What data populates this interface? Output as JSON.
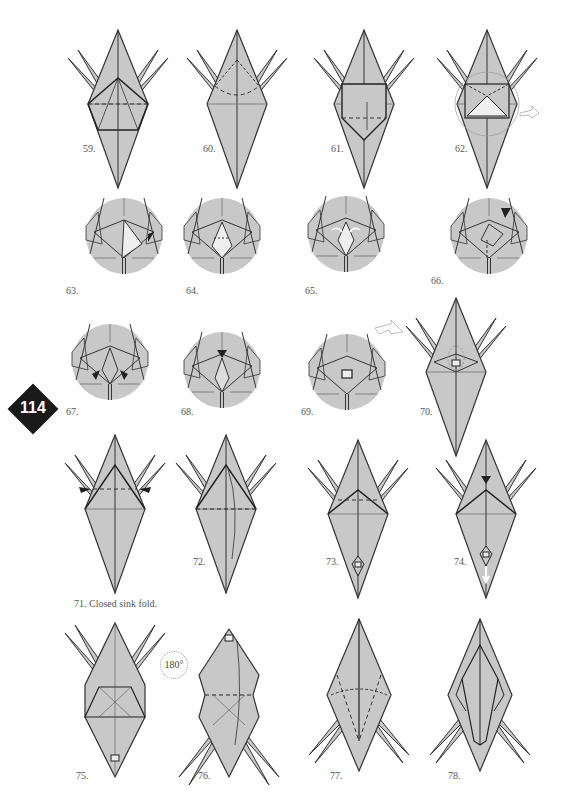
{
  "page": {
    "number": "114",
    "fill_color": "#c8c8c8",
    "line_color": "#333333"
  },
  "steps": [
    {
      "id": "59",
      "label": "59."
    },
    {
      "id": "60",
      "label": "60."
    },
    {
      "id": "61",
      "label": "61."
    },
    {
      "id": "62",
      "label": "62."
    },
    {
      "id": "63",
      "label": "63."
    },
    {
      "id": "64",
      "label": "64."
    },
    {
      "id": "65",
      "label": "65."
    },
    {
      "id": "66",
      "label": "66."
    },
    {
      "id": "67",
      "label": "67."
    },
    {
      "id": "68",
      "label": "68."
    },
    {
      "id": "69",
      "label": "69."
    },
    {
      "id": "70",
      "label": "70."
    },
    {
      "id": "71",
      "label": "71. Closed sink fold."
    },
    {
      "id": "72",
      "label": "72."
    },
    {
      "id": "73",
      "label": "73."
    },
    {
      "id": "74",
      "label": "74."
    },
    {
      "id": "75",
      "label": "75."
    },
    {
      "id": "76",
      "label": "76."
    },
    {
      "id": "77",
      "label": "77."
    },
    {
      "id": "78",
      "label": "78."
    }
  ],
  "annotations": {
    "rotate": "180°",
    "icons": [
      "valley-fold-arrow-icon",
      "sink-arrow-icon",
      "turn-over-icon",
      "rotate-icon",
      "pull-out-arrow-icon"
    ]
  }
}
